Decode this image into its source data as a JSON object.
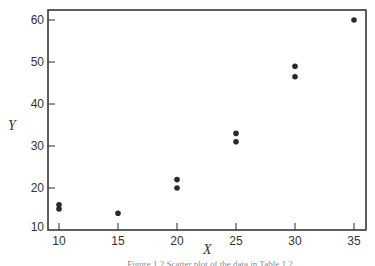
{
  "chart_data": {
    "type": "scatter",
    "title": "",
    "xlabel": "X",
    "ylabel": "Y",
    "xlim": [
      9,
      36.5
    ],
    "ylim": [
      10,
      62
    ],
    "x_ticks": [
      10,
      15,
      20,
      25,
      30,
      35
    ],
    "y_ticks": [
      10,
      20,
      30,
      40,
      50,
      60
    ],
    "grid": false,
    "legend": null,
    "series": [
      {
        "name": "data",
        "points": [
          {
            "x": 10,
            "y": 16
          },
          {
            "x": 10,
            "y": 15
          },
          {
            "x": 15,
            "y": 14
          },
          {
            "x": 20,
            "y": 22
          },
          {
            "x": 20,
            "y": 20
          },
          {
            "x": 25,
            "y": 33
          },
          {
            "x": 25,
            "y": 31
          },
          {
            "x": 30,
            "y": 49
          },
          {
            "x": 30,
            "y": 46.5
          },
          {
            "x": 35,
            "y": 60
          }
        ]
      }
    ],
    "caption": "Figure 1.2  Scatter plot of the data in Table 1.2"
  },
  "colors": {
    "axis": "#2a2a2a",
    "marker": "#2a2a2a"
  }
}
